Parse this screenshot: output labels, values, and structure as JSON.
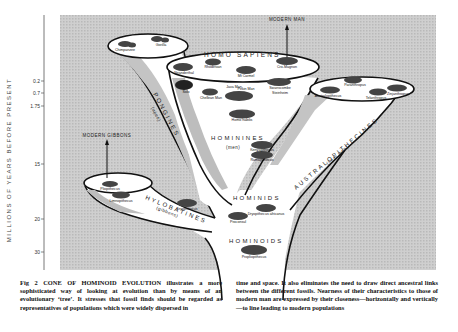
{
  "figure": {
    "axis": {
      "title": "MILLIONS OF YEARS BEFORE PRESENT",
      "ticks": [
        "0.2",
        "0.7",
        "1.75",
        "15",
        "20",
        "30"
      ]
    },
    "labels": {
      "modern_man": "MODERN MAN",
      "modern_gibbons": "MODERN GIBBONS",
      "homo_sapiens": "HOMO SAPIENS",
      "pongines": "PONGINES",
      "pongines_sub": "(apes)",
      "hominines": "HOMININES",
      "hominines_sub": "(men)",
      "australopithecines": "AUSTRALOPITHECINES",
      "australopithecines_sub": "(near men)",
      "hylobatines": "HYLOBATINES",
      "hylobatines_sub": "(gibbons)",
      "hominids": "HOMINIDS",
      "hominoids": "HOMINOIDS"
    },
    "fossils": {
      "chimpanzee": "Chimpanzee",
      "gorilla": "Gorilla",
      "neanderthal": "Neanderthal",
      "rhodesian": "Rhodesian",
      "mt_carmel": "Mt Carmel",
      "cro_magnon": "Cro-Magnon",
      "solo": "Solo",
      "java_man": "Java Man",
      "pekin_man": "Pekin Man",
      "chellean_man": "Chellean Man",
      "homo_habilis": "Homo habilis",
      "swanscombe": "Swanscombe",
      "steinheim": "Steinheim",
      "australopithecus": "Australopithecus",
      "paranthropus": "Paranthropus",
      "telanthropus": "Telanthropus",
      "zinjanthropus": "Zinjanthropus",
      "kenyapithecus": "Kenyapithecus",
      "ramapithecus": "Ramapithecus",
      "dryopithecus": "Dryopithecus",
      "pliopithecus": "Pliopithecus",
      "limnopithecus": "Limnopithecus",
      "proconsul": "Proconsul",
      "dryopithecus_africanus": "Dryopithecus africanus",
      "propliopithecus": "Propliopithecus"
    }
  },
  "caption": {
    "left": {
      "lead": "Fig 2  CONE OF HOMINOID EVOLUTION",
      "text": " illustrates a more sophisticated way of looking at evolution than by means of an evolutionary ‘tree’. It stresses that fossil finds should be regarded as representatives of populations which were widely dispersed in"
    },
    "right": {
      "text": "time and space. It also eliminates the need to draw direct ancestral links between the different fossils. Nearness of their characteristics to those of modern man are expressed by their closeness—horizontally and vertically—to line leading to modern populations"
    }
  }
}
